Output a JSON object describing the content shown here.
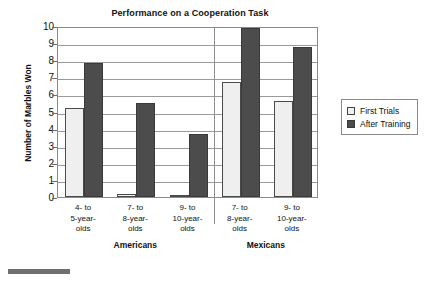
{
  "chart_data": {
    "type": "bar",
    "title": "Performance on a Cooperation Task",
    "xlabel": "",
    "ylabel": "Number of Marbles Won",
    "ylim": [
      0,
      10
    ],
    "yticks": [
      0,
      1,
      2,
      3,
      4,
      5,
      6,
      7,
      8,
      9,
      10
    ],
    "grid": true,
    "legend_position": "right",
    "categories": [
      "4- to\n5-year-\nolds",
      "7- to\n8-year-\nolds",
      "9- to\n10-year-\nolds",
      "7- to\n8-year-\nolds",
      "9- to\n10-year-\nolds"
    ],
    "groups": [
      {
        "name": "Americans",
        "categories": [
          0,
          1,
          2
        ]
      },
      {
        "name": "Mexicans",
        "categories": [
          3,
          4
        ]
      }
    ],
    "series": [
      {
        "name": "First Trials",
        "color": "#efefef",
        "values": [
          5.2,
          0.2,
          0.1,
          6.75,
          5.6
        ]
      },
      {
        "name": "After Training",
        "color": "#4c4c4c",
        "values": [
          7.85,
          5.5,
          3.7,
          9.9,
          8.8
        ]
      }
    ]
  },
  "chart": {
    "title": "Performance on a Cooperation Task",
    "y_axis_title": "Number of Marbles Won",
    "y_ticks": [
      "10",
      "9",
      "8",
      "7",
      "6",
      "5",
      "4",
      "3",
      "2",
      "1",
      "0"
    ],
    "categories": [
      {
        "line1": "4- to",
        "line2": "5-year-",
        "line3": "olds"
      },
      {
        "line1": "7- to",
        "line2": "8-year-",
        "line3": "olds"
      },
      {
        "line1": "9- to",
        "line2": "10-year-",
        "line3": "olds"
      },
      {
        "line1": "7- to",
        "line2": "8-year-",
        "line3": "olds"
      },
      {
        "line1": "9- to",
        "line2": "10-year-",
        "line3": "olds"
      }
    ],
    "supergroups": [
      {
        "label": "Americans"
      },
      {
        "label": "Mexicans"
      }
    ],
    "legend": [
      {
        "label": "First Trials",
        "swatch": "first"
      },
      {
        "label": "After Training",
        "swatch": "after"
      }
    ]
  }
}
